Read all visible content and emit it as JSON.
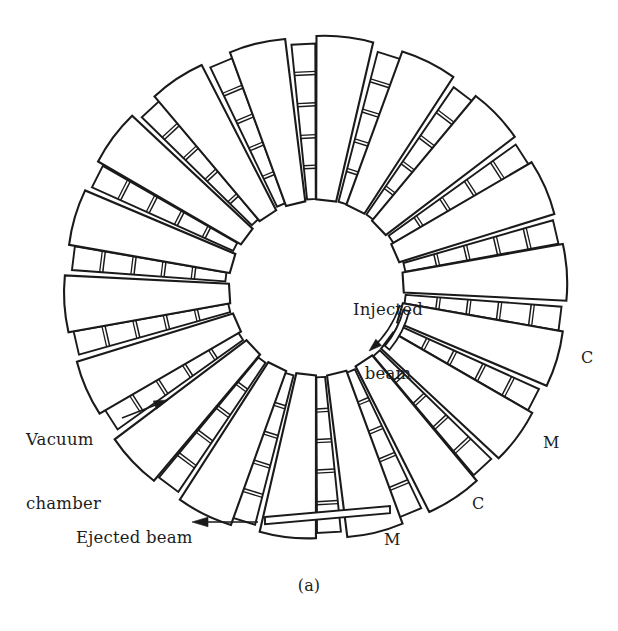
{
  "figure": {
    "caption": "(a)",
    "background_color": "#ffffff",
    "line_color": "#1a1a1a"
  },
  "annotations": {
    "injected_beam": {
      "label": "Injected\nbeam",
      "line1": "Injected",
      "line2": "beam",
      "arrow": "curved-arrow-down-left"
    },
    "vacuum_chamber": {
      "label": "Vacuum\nchamber",
      "line1": "Vacuum",
      "line2": "chamber",
      "arrow": "straight-arrow-up-right"
    },
    "ejected_beam": {
      "label": "Ejected beam",
      "arrow": "straight-arrow-left"
    }
  },
  "legend_marks": [
    {
      "id": "c-upper",
      "label": "C",
      "meaning": "cavity / vacuum chamber section"
    },
    {
      "id": "m-upper",
      "label": "M",
      "meaning": "magnet sector"
    },
    {
      "id": "c-lower",
      "label": "C",
      "meaning": "cavity / vacuum chamber section"
    },
    {
      "id": "m-lower",
      "label": "M",
      "meaning": "magnet sector"
    }
  ],
  "chart_data": {
    "type": "diagram",
    "geometry": {
      "center_x": 316,
      "center_y": 288,
      "inner_radius": 86,
      "outer_radius": 255,
      "sector_count": 18,
      "magnet_angular_width_deg": 13.0,
      "chamber_angular_width_deg": 5.6,
      "gap_angular_deg": 1.4,
      "chamber_segments_per_band": 5,
      "sector_pitch_deg": 20.0,
      "start_angle_deg": -90
    },
    "elements": [
      {
        "name": "magnet sector",
        "symbol": "M",
        "count": 18,
        "shape": "radial trapezoid, narrow end inward"
      },
      {
        "name": "vacuum chamber / cavity band",
        "symbol": "C",
        "count": 18,
        "shape": "narrow radial band divided into 5 segments"
      },
      {
        "name": "injection septum",
        "count": 1,
        "shape": "short curved arc at inner radius"
      },
      {
        "name": "ejection channel",
        "count": 1,
        "shape": "long thin rectangle tangent to ring, lower left"
      }
    ],
    "labels": [
      "Injected beam",
      "Vacuum chamber",
      "Ejected beam",
      "C",
      "M",
      "C",
      "M",
      "(a)"
    ]
  }
}
